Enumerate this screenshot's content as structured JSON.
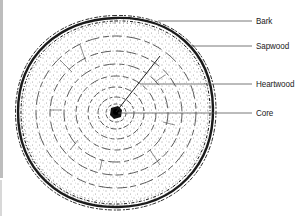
{
  "diagram": {
    "labels": [
      {
        "id": "bark",
        "text": "Bark"
      },
      {
        "id": "sapwood",
        "text": "Sapwood"
      },
      {
        "id": "heartwood",
        "text": "Heartwood"
      },
      {
        "id": "core",
        "text": "Core"
      }
    ],
    "colors": {
      "ink": "#222222",
      "leader": "#555555",
      "background": "#ffffff"
    }
  }
}
